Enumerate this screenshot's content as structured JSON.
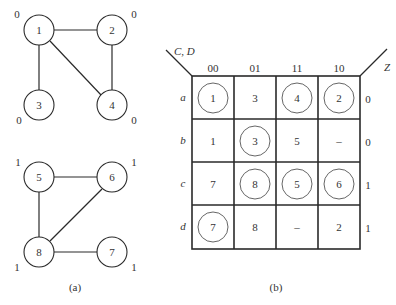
{
  "graph_a": {
    "caption": "(a)",
    "nodes": [
      {
        "id": "1",
        "label": "1",
        "output": "0"
      },
      {
        "id": "2",
        "label": "2",
        "output": "0"
      },
      {
        "id": "3",
        "label": "3",
        "output": "0"
      },
      {
        "id": "4",
        "label": "4",
        "output": "0"
      },
      {
        "id": "5",
        "label": "5",
        "output": "1"
      },
      {
        "id": "6",
        "label": "6",
        "output": "1"
      },
      {
        "id": "7",
        "label": "7",
        "output": "1"
      },
      {
        "id": "8",
        "label": "8",
        "output": "1"
      }
    ],
    "edges": [
      [
        "1",
        "2"
      ],
      [
        "1",
        "3"
      ],
      [
        "1",
        "4"
      ],
      [
        "2",
        "4"
      ],
      [
        "5",
        "6"
      ],
      [
        "5",
        "8"
      ],
      [
        "6",
        "8"
      ],
      [
        "8",
        "7"
      ]
    ]
  },
  "map_b": {
    "caption": "(b)",
    "corner_label": "C, D",
    "output_label": "Z",
    "column_headers": [
      "00",
      "01",
      "11",
      "10"
    ],
    "row_labels": [
      "a",
      "b",
      "c",
      "d"
    ],
    "cells": [
      [
        {
          "v": "1",
          "circled": true
        },
        {
          "v": "3",
          "circled": false
        },
        {
          "v": "4",
          "circled": true
        },
        {
          "v": "2",
          "circled": true
        }
      ],
      [
        {
          "v": "1",
          "circled": false
        },
        {
          "v": "3",
          "circled": true
        },
        {
          "v": "5",
          "circled": false
        },
        {
          "v": "–",
          "circled": false
        }
      ],
      [
        {
          "v": "7",
          "circled": false
        },
        {
          "v": "8",
          "circled": true
        },
        {
          "v": "5",
          "circled": true
        },
        {
          "v": "6",
          "circled": true
        }
      ],
      [
        {
          "v": "7",
          "circled": true
        },
        {
          "v": "8",
          "circled": false
        },
        {
          "v": "–",
          "circled": false
        },
        {
          "v": "2",
          "circled": false
        }
      ]
    ],
    "outputs": [
      "0",
      "0",
      "1",
      "1"
    ]
  }
}
